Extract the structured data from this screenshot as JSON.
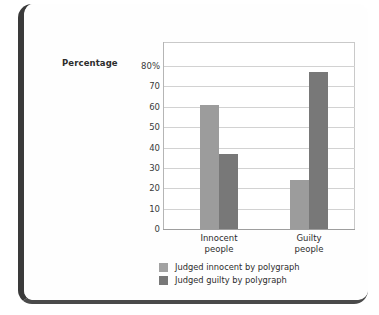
{
  "frame": {
    "card_name": "scanned-page-card"
  },
  "chart_data": {
    "type": "bar",
    "title": "",
    "subtitle": "",
    "xlabel": "",
    "ylabel": "Percentage",
    "ylim": [
      0,
      80
    ],
    "grid": true,
    "legend_position": "bottom",
    "categories": [
      "Innocent people",
      "Guilty people"
    ],
    "category_lines": [
      {
        "line1": "Innocent",
        "line2": "people"
      },
      {
        "line1": "Guilty",
        "line2": "people"
      }
    ],
    "ytick_labels": [
      "80%",
      "70",
      "60",
      "50",
      "40",
      "30",
      "20",
      "10",
      "0"
    ],
    "ytick_values": [
      80,
      70,
      60,
      50,
      40,
      30,
      20,
      10,
      0
    ],
    "series": [
      {
        "name": "Judged innocent by polygraph",
        "color": "#9c9c9c",
        "values": [
          61,
          24
        ]
      },
      {
        "name": "Judged guilty by polygraph",
        "color": "#787878",
        "values": [
          37,
          77
        ]
      }
    ]
  },
  "legend": {
    "items": [
      {
        "label": "Judged innocent by polygraph",
        "swatch": "light"
      },
      {
        "label": "Judged guilty by polygraph",
        "swatch": "dark"
      }
    ]
  }
}
